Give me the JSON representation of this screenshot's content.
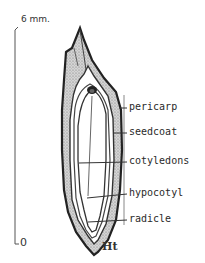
{
  "scale_bar": {
    "top_label": "6 mm.",
    "bottom_label": "0"
  },
  "labels": [
    {
      "id": "pericarp",
      "text": "pericarp"
    },
    {
      "id": "seedcoat",
      "text": "seedcoat"
    },
    {
      "id": "cotyledons",
      "text": "cotyledons"
    },
    {
      "id": "hypocotyl",
      "text": "hypocotyl"
    },
    {
      "id": "radicle",
      "text": "radicle"
    }
  ],
  "signature": "Ht",
  "colors": {
    "ink": "#2a2a2a",
    "stipple": "#8a8a8a",
    "background": "#ffffff"
  }
}
